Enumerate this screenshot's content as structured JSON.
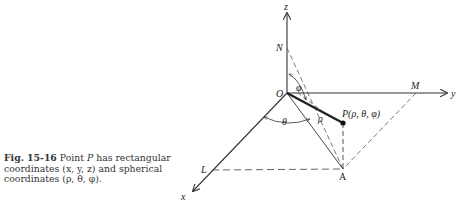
{
  "caption": {
    "figure_label": "Fig.  15-16",
    "text_part1": "Point ",
    "point_name": "P",
    "text_part2": " has rectangular coordinates (x, y, z) and spherical coordinates (ρ, θ, φ)."
  },
  "diagram": {
    "axes": {
      "x": "x",
      "y": "y",
      "z": "z"
    },
    "points": {
      "origin": "O",
      "N": "N",
      "M": "M",
      "L": "L",
      "A": "A"
    },
    "point_P_label": "P(ρ, θ, φ)",
    "angles": {
      "phi": "φ",
      "theta": "θ"
    },
    "radius": "ρ",
    "colors": {
      "line": "#333333",
      "dashed": "#555555"
    }
  }
}
